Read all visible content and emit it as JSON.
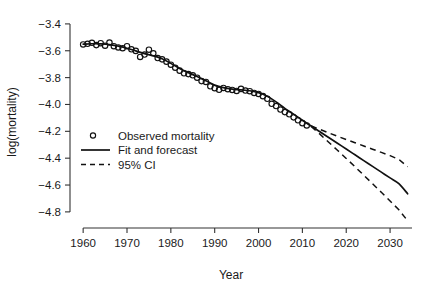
{
  "chart_data": {
    "type": "line",
    "title": "",
    "xlabel": "Year",
    "ylabel": "log(mortality)",
    "xlim": [
      1957,
      2035
    ],
    "ylim": [
      -4.92,
      -3.33
    ],
    "xticks": [
      1960,
      1970,
      1980,
      1990,
      2000,
      2010,
      2020,
      2030
    ],
    "xticklabels": [
      "1960",
      "1970",
      "1980",
      "1990",
      "2000",
      "2010",
      "2020",
      "2030"
    ],
    "yticks": [
      -3.4,
      -3.6,
      -3.8,
      -4.0,
      -4.2,
      -4.4,
      -4.6,
      -4.8
    ],
    "yticklabels": [
      "−3.4",
      "−3.6",
      "−3.8",
      "−4.0",
      "−4.2",
      "−4.4",
      "−4.6",
      "−4.8"
    ],
    "grid": false,
    "legend_position": "center-left",
    "legend": [
      {
        "label": "Observed mortality",
        "marker": "circle",
        "style": "none"
      },
      {
        "label": "Fit and forecast",
        "marker": "none",
        "style": "solid"
      },
      {
        "label": "95% CI",
        "marker": "none",
        "style": "dashed"
      }
    ],
    "series": [
      {
        "name": "Observed mortality",
        "type": "scatter",
        "marker": "open-circle",
        "x": [
          1960,
          1961,
          1962,
          1963,
          1964,
          1965,
          1966,
          1967,
          1968,
          1969,
          1970,
          1971,
          1972,
          1973,
          1974,
          1975,
          1976,
          1977,
          1978,
          1979,
          1980,
          1981,
          1982,
          1983,
          1984,
          1985,
          1986,
          1987,
          1988,
          1989,
          1990,
          1991,
          1992,
          1993,
          1994,
          1995,
          1996,
          1997,
          1998,
          1999,
          2000,
          2001,
          2002,
          2003,
          2004,
          2005,
          2006,
          2007,
          2008,
          2009,
          2010,
          2011
        ],
        "y": [
          -3.553,
          -3.548,
          -3.541,
          -3.558,
          -3.544,
          -3.562,
          -3.539,
          -3.566,
          -3.575,
          -3.581,
          -3.566,
          -3.589,
          -3.601,
          -3.646,
          -3.628,
          -3.592,
          -3.619,
          -3.654,
          -3.664,
          -3.681,
          -3.704,
          -3.726,
          -3.748,
          -3.768,
          -3.774,
          -3.783,
          -3.801,
          -3.826,
          -3.832,
          -3.865,
          -3.879,
          -3.891,
          -3.877,
          -3.886,
          -3.892,
          -3.899,
          -3.884,
          -3.896,
          -3.901,
          -3.914,
          -3.922,
          -3.938,
          -3.958,
          -3.995,
          -4.012,
          -4.038,
          -4.057,
          -4.073,
          -4.096,
          -4.118,
          -4.139,
          -4.156
        ]
      },
      {
        "name": "Fit and forecast",
        "type": "line",
        "style": "solid",
        "x": [
          1960,
          1962,
          1964,
          1966,
          1968,
          1970,
          1972,
          1974,
          1976,
          1978,
          1980,
          1982,
          1984,
          1986,
          1988,
          1990,
          1992,
          1994,
          1996,
          1998,
          2000,
          2002,
          2004,
          2006,
          2008,
          2010,
          2012,
          2014,
          2016,
          2018,
          2020,
          2022,
          2024,
          2026,
          2028,
          2030,
          2032,
          2034
        ],
        "y": [
          -3.551,
          -3.548,
          -3.549,
          -3.554,
          -3.566,
          -3.581,
          -3.601,
          -3.621,
          -3.637,
          -3.659,
          -3.694,
          -3.732,
          -3.763,
          -3.792,
          -3.824,
          -3.856,
          -3.875,
          -3.886,
          -3.891,
          -3.898,
          -3.912,
          -3.939,
          -3.981,
          -4.029,
          -4.072,
          -4.117,
          -4.161,
          -4.203,
          -4.246,
          -4.289,
          -4.332,
          -4.375,
          -4.418,
          -4.461,
          -4.504,
          -4.547,
          -4.59,
          -4.665
        ]
      },
      {
        "name": "95% CI upper",
        "type": "line",
        "style": "dashed",
        "x": [
          2012,
          2014,
          2016,
          2018,
          2020,
          2022,
          2024,
          2026,
          2028,
          2030,
          2032,
          2034
        ],
        "y": [
          -4.159,
          -4.186,
          -4.212,
          -4.237,
          -4.261,
          -4.285,
          -4.309,
          -4.333,
          -4.357,
          -4.381,
          -4.409,
          -4.464
        ]
      },
      {
        "name": "95% CI lower",
        "type": "line",
        "style": "dashed",
        "x": [
          2012,
          2014,
          2016,
          2018,
          2020,
          2022,
          2024,
          2026,
          2028,
          2030,
          2032,
          2034
        ],
        "y": [
          -4.164,
          -4.221,
          -4.281,
          -4.341,
          -4.402,
          -4.464,
          -4.527,
          -4.59,
          -4.654,
          -4.719,
          -4.784,
          -4.866
        ]
      }
    ],
    "colors": {
      "line": "#111111",
      "marker": "#111111",
      "axis": "#333333",
      "background": "#ffffff"
    }
  }
}
